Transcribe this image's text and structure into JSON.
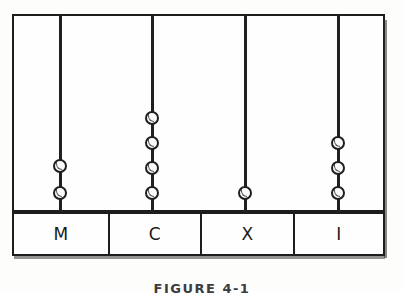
{
  "figure": {
    "caption": "FIGURE 4-1",
    "ink_color": "#1d1d1d",
    "paper_color": "#fefefe"
  },
  "frame": {
    "x": 12,
    "y": 14,
    "width": 373,
    "height": 198,
    "partitions_x": [
      60,
      152,
      245,
      338
    ]
  },
  "columns": [
    {
      "id": "M",
      "label": "M",
      "rod_x": 60,
      "bead_count": 2,
      "bead_y": [
        166,
        193
      ]
    },
    {
      "id": "C",
      "label": "C",
      "rod_x": 152,
      "bead_count": 4,
      "bead_y": [
        118,
        143,
        168,
        193
      ]
    },
    {
      "id": "X",
      "label": "X",
      "rod_x": 245,
      "bead_count": 1,
      "bead_y": [
        193
      ]
    },
    {
      "id": "I",
      "label": "I",
      "rod_x": 338,
      "bead_count": 3,
      "bead_y": [
        143,
        168,
        193
      ]
    }
  ],
  "label_row": {
    "x": 12,
    "y": 212,
    "width": 373,
    "height": 44,
    "cells": [
      {
        "label": "M",
        "width": 96
      },
      {
        "label": "C",
        "width": 92
      },
      {
        "label": "X",
        "width": 93
      },
      {
        "label": "I",
        "width": 88
      }
    ]
  },
  "chart_data": {
    "type": "bar",
    "title": "FIGURE 4-1",
    "xlabel": "",
    "ylabel": "Beads on rod",
    "categories": [
      "M",
      "C",
      "X",
      "I"
    ],
    "values": [
      2,
      4,
      1,
      3
    ],
    "ylim": [
      0,
      4
    ],
    "grid": false,
    "legend": "none",
    "annotations": [
      "Roman counting board showing 2 M-beads, 4 C-beads, 1 X-bead, 3 I-beads"
    ]
  }
}
